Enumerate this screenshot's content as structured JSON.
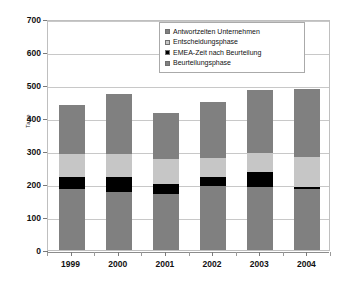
{
  "chart_data": {
    "type": "bar",
    "subtype": "stacked-bar",
    "title": "",
    "xlabel": "",
    "ylabel": "Tage",
    "ylim": [
      0,
      700
    ],
    "ytick_step": 100,
    "yticks": [
      0,
      100,
      200,
      300,
      400,
      500,
      600,
      700
    ],
    "grid": true,
    "legend_position": "top-right-inside",
    "categories": [
      "1999",
      "2000",
      "2001",
      "2002",
      "2003",
      "2004"
    ],
    "series": [
      {
        "name": "Beurteilungsphase",
        "color": "#808080",
        "stack_order": 1,
        "values": [
          185,
          177,
          170,
          195,
          190,
          186
        ]
      },
      {
        "name": "EMEA-Zeit nach Beurteilung",
        "color": "#000000",
        "stack_order": 2,
        "values": [
          35,
          45,
          30,
          25,
          47,
          5
        ]
      },
      {
        "name": "Entscheidungsphase",
        "color": "#c6c6c6",
        "stack_order": 3,
        "values": [
          70,
          70,
          75,
          60,
          56,
          92
        ]
      },
      {
        "name": "Antwortzeiten Unternehmen",
        "color": "#808080",
        "stack_order": 4,
        "values": [
          150,
          180,
          140,
          170,
          192,
          205
        ]
      }
    ],
    "totals": [
      440,
      472,
      415,
      450,
      485,
      488
    ],
    "legend_entries": [
      {
        "label": "Antwortzeiten Unternehmen",
        "color": "#808080"
      },
      {
        "label": "Entscheidungsphase",
        "color": "#c6c6c6"
      },
      {
        "label": "EMEA-Zeit nach Beurteilung",
        "color": "#000000"
      },
      {
        "label": "Beurteilungsphase",
        "color": "#808080"
      }
    ]
  },
  "axes": {
    "y_title": "Tage",
    "y_tick_labels": [
      "700",
      "600",
      "500",
      "400",
      "300",
      "200",
      "100",
      "0"
    ],
    "x_tick_labels": [
      "1999",
      "2000",
      "2001",
      "2002",
      "2003",
      "2004"
    ]
  },
  "colors": {
    "plot_border": "#bfbfbf",
    "gridline": "#c8c8c8",
    "axis": "#7a7a7a",
    "text": "#111111",
    "background": "#ffffff"
  }
}
